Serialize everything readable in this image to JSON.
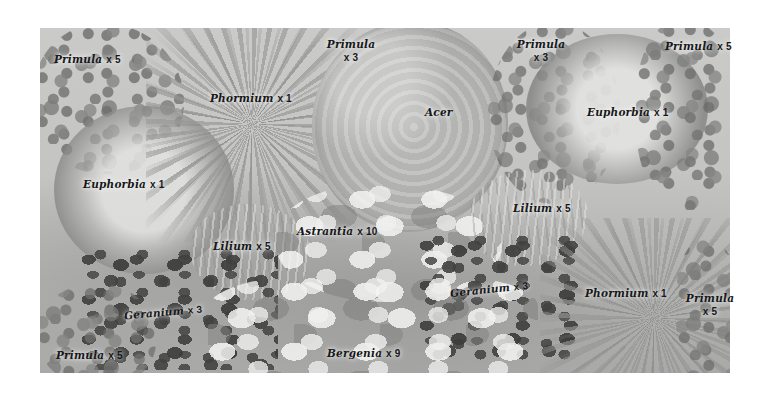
{
  "plan": {
    "title": "Garden border planting plan",
    "palette": {
      "paper": "#ffffff",
      "bed_light": "#c9cbc4",
      "bed_mid": "#b0b2aa",
      "bed_dark": "#a8aaa2",
      "foliage_dark": "#3a3c38",
      "label_text": "#17181a"
    }
  },
  "labels": [
    {
      "id": "primula-top-left",
      "plant": "Primula",
      "qty": "x 5",
      "multiline": false
    },
    {
      "id": "phormium-top-left",
      "plant": "Phormium",
      "qty": "x 1",
      "multiline": false
    },
    {
      "id": "primula-top-center",
      "plant": "Primula",
      "qty": "x 3",
      "multiline": true
    },
    {
      "id": "acer-center",
      "plant": "Acer",
      "qty": "",
      "multiline": false
    },
    {
      "id": "primula-top-right-mid",
      "plant": "Primula",
      "qty": "x 3",
      "multiline": true
    },
    {
      "id": "primula-top-right",
      "plant": "Primula",
      "qty": "x 5",
      "multiline": false
    },
    {
      "id": "euphorbia-right",
      "plant": "Euphorbia",
      "qty": "x 1",
      "multiline": false
    },
    {
      "id": "euphorbia-left",
      "plant": "Euphorbia",
      "qty": "x 1",
      "multiline": false
    },
    {
      "id": "lilium-right",
      "plant": "Lilium",
      "qty": "x 5",
      "multiline": false
    },
    {
      "id": "astrantia-center",
      "plant": "Astrantia",
      "qty": "x 10",
      "multiline": false
    },
    {
      "id": "lilium-left",
      "plant": "Lilium",
      "qty": "x 5",
      "multiline": false
    },
    {
      "id": "geranium-right",
      "plant": "Geranium",
      "qty": "x 3",
      "multiline": false
    },
    {
      "id": "phormium-bottom-right",
      "plant": "Phormium",
      "qty": "x 1",
      "multiline": false
    },
    {
      "id": "primula-bottom-right",
      "plant": "Primula",
      "qty": "x 5",
      "multiline": true
    },
    {
      "id": "geranium-left",
      "plant": "Geranium",
      "qty": "x 3",
      "multiline": false
    },
    {
      "id": "primula-bottom-left",
      "plant": "Primula",
      "qty": "x 5",
      "multiline": false
    },
    {
      "id": "bergenia-bottom",
      "plant": "Bergenia",
      "qty": "x 9",
      "multiline": false
    }
  ],
  "plants": [
    {
      "id": "primula-mass-top-left",
      "name": "Primula",
      "form": "mottle"
    },
    {
      "id": "euphorbia-dome-left",
      "name": "Euphorbia",
      "form": "dome"
    },
    {
      "id": "phormium-rosette-top",
      "name": "Phormium",
      "form": "rosette"
    },
    {
      "id": "acer-canopy",
      "name": "Acer",
      "form": "canopy"
    },
    {
      "id": "primula-mass-top-right",
      "name": "Primula",
      "form": "mottle"
    },
    {
      "id": "euphorbia-dome-right",
      "name": "Euphorbia",
      "form": "dome"
    },
    {
      "id": "primula-mass-far-right",
      "name": "Primula",
      "form": "mottle"
    },
    {
      "id": "lilium-clump-left",
      "name": "Lilium",
      "form": "upright"
    },
    {
      "id": "astrantia-mass",
      "name": "Astrantia",
      "form": "broadleaf"
    },
    {
      "id": "lilium-clump-right",
      "name": "Lilium",
      "form": "upright"
    },
    {
      "id": "geranium-mass-left",
      "name": "Geranium",
      "form": "speckle"
    },
    {
      "id": "geranium-mass-right",
      "name": "Geranium",
      "form": "speckle"
    },
    {
      "id": "bergenia-mass",
      "name": "Bergenia",
      "form": "broadleaf"
    },
    {
      "id": "phormium-rosette-bottom",
      "name": "Phormium",
      "form": "rosette"
    },
    {
      "id": "primula-mass-bottom-right",
      "name": "Primula",
      "form": "mottle"
    },
    {
      "id": "primula-mass-bottom-left",
      "name": "Primula",
      "form": "mottle"
    }
  ]
}
